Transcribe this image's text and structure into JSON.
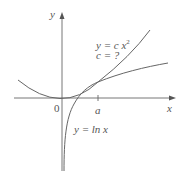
{
  "figure": {
    "axis_labels": {
      "x": "x",
      "y": "y"
    },
    "origin_label": "0",
    "tick_label": "a",
    "curve_parabola": {
      "equation_line1": "y = c x",
      "exponent": "2",
      "equation_line2": "c = ?"
    },
    "curve_log": {
      "equation": "y = ln x"
    },
    "colors": {
      "axes": "#555555",
      "curves": "#555555",
      "text": "#555555"
    }
  }
}
